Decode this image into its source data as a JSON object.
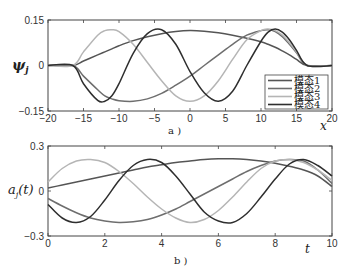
{
  "chart_data": [
    {
      "type": "line",
      "panel": "a)",
      "ylabel": "ψ_j",
      "xlabel": "x",
      "xlim": [
        -20,
        20
      ],
      "ylim": [
        -0.15,
        0.15
      ],
      "xticks": [
        "-20",
        "-15",
        "-10",
        "-5",
        "0",
        "5",
        "10",
        "15",
        "20"
      ],
      "yticks": [
        "-0.15",
        "0",
        "0.15"
      ],
      "grid": false,
      "legend_position": "lower right",
      "x": [
        -20,
        -16.5,
        -15,
        -13,
        -12,
        -11,
        -10,
        -8,
        -6,
        -4,
        -2,
        0,
        2,
        4,
        6,
        8,
        10,
        11,
        12,
        13,
        14,
        15,
        16.5,
        20
      ],
      "series": [
        {
          "name": "模态1",
          "color": "#555555",
          "values": [
            0,
            0,
            0.015,
            0.035,
            0.045,
            0.055,
            0.065,
            0.082,
            0.095,
            0.105,
            0.112,
            0.115,
            0.113,
            0.108,
            0.1,
            0.09,
            0.078,
            0.07,
            0.06,
            0.048,
            0.035,
            0.02,
            0,
            0
          ]
        },
        {
          "name": "模态2",
          "color": "#6e6e6e",
          "values": [
            0,
            0,
            -0.035,
            -0.08,
            -0.1,
            -0.11,
            -0.116,
            -0.118,
            -0.11,
            -0.092,
            -0.065,
            -0.035,
            0,
            0.035,
            0.07,
            0.1,
            0.115,
            0.118,
            0.112,
            0.095,
            0.07,
            0.042,
            0,
            0
          ]
        },
        {
          "name": "模态3",
          "color": "#b5b5b5",
          "values": [
            0,
            0,
            0.045,
            0.1,
            0.115,
            0.118,
            0.112,
            0.07,
            0.01,
            -0.05,
            -0.1,
            -0.118,
            -0.1,
            -0.05,
            0.02,
            0.085,
            0.115,
            0.12,
            0.115,
            0.1,
            0.075,
            0.045,
            0,
            0
          ]
        },
        {
          "name": "模态4",
          "color": "#2e2e2e",
          "values": [
            0,
            0,
            -0.06,
            -0.115,
            -0.118,
            -0.1,
            -0.06,
            0.04,
            0.105,
            0.118,
            0.07,
            -0.02,
            -0.09,
            -0.118,
            -0.085,
            0.0,
            0.08,
            0.11,
            0.12,
            0.11,
            0.085,
            0.05,
            0,
            0
          ]
        }
      ]
    },
    {
      "type": "line",
      "panel": "b)",
      "ylabel": "a_j(t)",
      "xlabel": "t",
      "xlim": [
        0,
        10
      ],
      "ylim": [
        -0.3,
        0.3
      ],
      "xticks": [
        "0",
        "2",
        "4",
        "6",
        "8",
        "10"
      ],
      "yticks": [
        "-0.3",
        "0",
        "0.3"
      ],
      "grid": false,
      "x": [
        0,
        0.5,
        1,
        1.5,
        2,
        2.5,
        3,
        3.5,
        4,
        4.5,
        5,
        5.5,
        6,
        6.5,
        7,
        7.5,
        8,
        8.5,
        9,
        9.5,
        10
      ],
      "series": [
        {
          "name": "模态1",
          "color": "#555555",
          "values": [
            0.02,
            0.04,
            0.06,
            0.08,
            0.1,
            0.12,
            0.14,
            0.16,
            0.175,
            0.19,
            0.2,
            0.21,
            0.215,
            0.215,
            0.21,
            0.2,
            0.185,
            0.165,
            0.14,
            0.1,
            0.03
          ]
        },
        {
          "name": "模态2",
          "color": "#6e6e6e",
          "values": [
            -0.05,
            -0.1,
            -0.145,
            -0.18,
            -0.2,
            -0.21,
            -0.205,
            -0.19,
            -0.16,
            -0.12,
            -0.07,
            -0.02,
            0.03,
            0.08,
            0.13,
            0.17,
            0.2,
            0.21,
            0.2,
            0.14,
            0.05
          ]
        },
        {
          "name": "模态3",
          "color": "#b5b5b5",
          "values": [
            0.06,
            0.15,
            0.2,
            0.21,
            0.19,
            0.13,
            0.05,
            -0.04,
            -0.12,
            -0.18,
            -0.21,
            -0.19,
            -0.13,
            -0.04,
            0.06,
            0.15,
            0.2,
            0.21,
            0.19,
            0.14,
            0.07
          ]
        },
        {
          "name": "模态4",
          "color": "#2e2e2e",
          "values": [
            -0.09,
            -0.18,
            -0.21,
            -0.17,
            -0.06,
            0.07,
            0.17,
            0.21,
            0.19,
            0.1,
            -0.02,
            -0.14,
            -0.2,
            -0.21,
            -0.15,
            -0.04,
            0.08,
            0.18,
            0.21,
            0.17,
            0.1
          ]
        }
      ]
    }
  ],
  "panels": {
    "a": {
      "caption": "a )",
      "ylabel_main": "ψ",
      "ylabel_sub": "j",
      "xlabel": "x"
    },
    "b": {
      "caption": "b )",
      "ylabel": "a",
      "ylabel_sub": "j",
      "ylabel_arg": "(t)",
      "xlabel": "t"
    }
  },
  "legend": [
    "模态1",
    "模态2",
    "模态3",
    "模态4"
  ]
}
